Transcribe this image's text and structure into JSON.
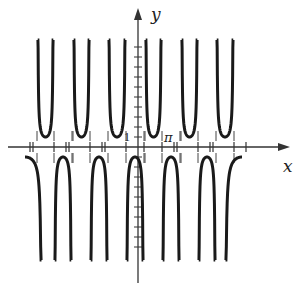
{
  "chart_data": {
    "type": "line",
    "title": "",
    "function_family": "secant-like (reciprocal trig): U-branches above y=1, inverted branches below y=-1",
    "xlabel": "x",
    "ylabel": "y",
    "labels": {
      "x_axis": "x",
      "y_axis": "y",
      "y_unit_tick": "1",
      "x_marker": "π"
    },
    "grid": false,
    "legend": null,
    "ylim": [
      -10,
      10
    ],
    "upper_branch_min": 1,
    "lower_branch_max": -1,
    "y_ticks_positive": 10,
    "y_ticks_negative": 10,
    "upper_branches_count": 6,
    "lower_branches_count": 5,
    "lower_partial_branches": 2,
    "colors": {
      "curve": "#1a1a1a",
      "axes": "#333333",
      "asymptote": "#444444"
    }
  },
  "geometry": {
    "origin_px": [
      138,
      147
    ],
    "unit_px": 10,
    "upper_pairs": [
      [
        37,
        54
      ],
      [
        73,
        90
      ],
      [
        108,
        126
      ],
      [
        145,
        162
      ],
      [
        181,
        198
      ],
      [
        216,
        234
      ]
    ],
    "lower_pairs": [
      [
        54,
        72
      ],
      [
        90,
        108
      ],
      [
        126,
        144
      ],
      [
        162,
        180
      ],
      [
        198,
        216
      ]
    ],
    "lower_partial_left": 35,
    "lower_partial_right": 234,
    "x_ticks": [
      30,
      33,
      54,
      66,
      69,
      90,
      102,
      105,
      126,
      144,
      162,
      174,
      177,
      198,
      210,
      213,
      234,
      246
    ]
  }
}
